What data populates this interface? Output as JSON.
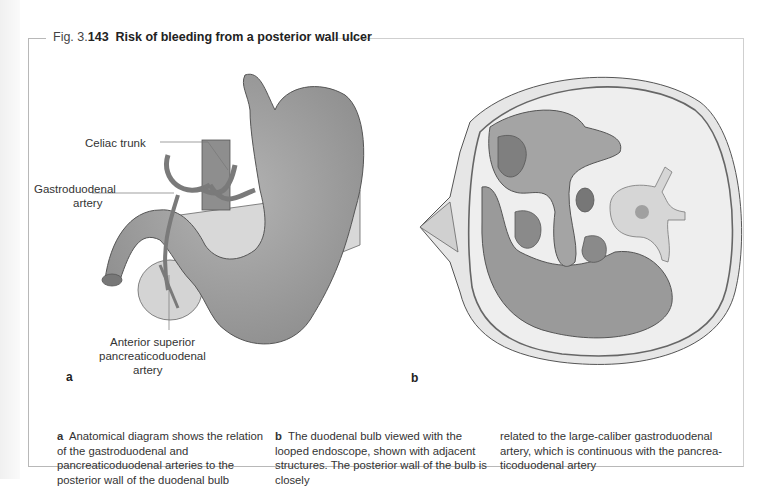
{
  "figure": {
    "number_prefix": "Fig. 3.",
    "number": "143",
    "title": "Risk of bleeding from a posterior wall ulcer"
  },
  "panel_a": {
    "letter": "a",
    "labels": {
      "celiac_trunk": "Celiac trunk",
      "gastroduodenal_1": "Gastroduodenal",
      "gastroduodenal_2": "artery",
      "asp_1": "Anterior superior",
      "asp_2": "pancreaticoduodenal",
      "asp_3": "artery"
    }
  },
  "panel_b": {
    "letter": "b"
  },
  "captions": {
    "a_letter": "a",
    "a_text": "Anatomical diagram shows the relation of the gastroduodenal and pancreaticoduodenal arteries to the posterior wall of the duodenal bulb",
    "b_letter": "b",
    "b_text": "The duodenal bulb viewed with the looped endoscope, shown with adjacent structures. The posterior wall of the bulb is closely",
    "b_text_cont": "related to the large-caliber gastroduodenal artery, which is continuous with the pancrea-ticoduodenal artery"
  },
  "colors": {
    "organ_fill": "#a9a9a9",
    "organ_light": "#d6d6d6",
    "outline": "#555555",
    "frame": "#b8b8b8"
  }
}
